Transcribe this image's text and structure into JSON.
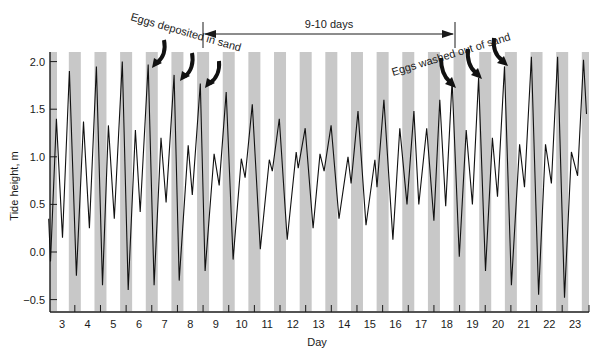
{
  "chart_data": {
    "type": "line",
    "title": "",
    "xlabel": "Day",
    "ylabel": "Tide height, m",
    "xlim": [
      2.5,
      23.5
    ],
    "ylim": [
      -0.6,
      2.1
    ],
    "x_ticks": [
      "3",
      "4",
      "5",
      "6",
      "7",
      "8",
      "9",
      "10",
      "11",
      "12",
      "13",
      "14",
      "15",
      "16",
      "17",
      "18",
      "19",
      "20",
      "21",
      "22",
      "23"
    ],
    "y_ticks": [
      "2.0",
      "1.5",
      "1.0",
      "0.5",
      "0.0",
      "−0.5"
    ],
    "y_tick_values": [
      2.0,
      1.5,
      1.0,
      0.5,
      0.0,
      -0.5
    ],
    "grid": false,
    "legend": null,
    "shaded_bands": {
      "meaning": "night",
      "color": "#c8c8c8",
      "centers_day": [
        2.62,
        3.5,
        4.5,
        5.5,
        6.5,
        7.5,
        8.5,
        9.5,
        10.5,
        11.5,
        12.5,
        13.5,
        14.5,
        15.5,
        16.5,
        17.5,
        18.5,
        19.5,
        20.5,
        21.5,
        22.5,
        23.5
      ]
    },
    "series": [
      {
        "name": "Tide height",
        "color": "#111111",
        "x": [
          2.48,
          2.55,
          2.78,
          3.02,
          3.29,
          3.56,
          3.84,
          4.07,
          4.34,
          4.58,
          4.81,
          5.04,
          5.35,
          5.58,
          5.86,
          6.05,
          6.36,
          6.59,
          6.86,
          7.06,
          7.37,
          7.57,
          7.92,
          8.08,
          8.39,
          8.58,
          8.93,
          9.13,
          9.4,
          9.67,
          9.99,
          10.14,
          10.42,
          10.73,
          11.08,
          11.2,
          11.47,
          11.78,
          12.13,
          12.21,
          12.48,
          12.79,
          13.06,
          13.22,
          13.49,
          13.8,
          14.15,
          14.27,
          14.54,
          14.85,
          15.2,
          15.28,
          15.55,
          15.9,
          16.17,
          16.45,
          16.72,
          16.91,
          17.22,
          17.5,
          17.73,
          17.96,
          18.21,
          18.49,
          18.76,
          19.0,
          19.24,
          19.51,
          19.78,
          19.98,
          20.25,
          20.52,
          20.84,
          21.03,
          21.3,
          21.58,
          21.85,
          22.08,
          22.32,
          22.59,
          22.86,
          23.1,
          23.33,
          23.45
        ],
        "y": [
          0.35,
          -0.1,
          1.4,
          0.15,
          1.9,
          -0.25,
          1.37,
          0.25,
          1.95,
          -0.35,
          1.33,
          0.35,
          2.0,
          -0.4,
          1.28,
          0.42,
          1.97,
          -0.35,
          1.2,
          0.52,
          1.86,
          -0.3,
          1.12,
          0.6,
          1.77,
          -0.2,
          1.03,
          0.7,
          1.68,
          -0.08,
          0.98,
          0.78,
          1.55,
          0.03,
          0.97,
          0.85,
          1.4,
          0.13,
          1.05,
          0.88,
          1.3,
          0.25,
          1.03,
          0.85,
          1.33,
          0.35,
          1.0,
          0.72,
          1.48,
          0.28,
          0.97,
          0.68,
          1.6,
          0.13,
          1.3,
          0.5,
          1.48,
          0.5,
          1.3,
          0.33,
          1.6,
          0.48,
          1.8,
          -0.05,
          1.28,
          0.5,
          1.83,
          -0.2,
          1.2,
          0.58,
          1.95,
          -0.35,
          1.13,
          0.68,
          2.05,
          -0.45,
          1.13,
          0.72,
          2.05,
          -0.48,
          1.05,
          0.8,
          2.02,
          1.45
        ]
      }
    ],
    "annotations": [
      {
        "text": "Eggs deposited in sand",
        "arrows_to_days": [
          6.55,
          7.6,
          8.55
        ]
      },
      {
        "text": "Eggs washed out of sand",
        "arrows_to_days": [
          18.35,
          19.35,
          20.35
        ]
      },
      {
        "text": "9-10 days",
        "type": "span",
        "from_day": 8.5,
        "to_day": 18.3
      }
    ]
  },
  "labels": {
    "ylabel": "Tide height, m",
    "xlabel": "Day",
    "span": "9-10 days",
    "deposited": "Eggs deposited in sand",
    "washed": "Eggs washed out of sand"
  }
}
